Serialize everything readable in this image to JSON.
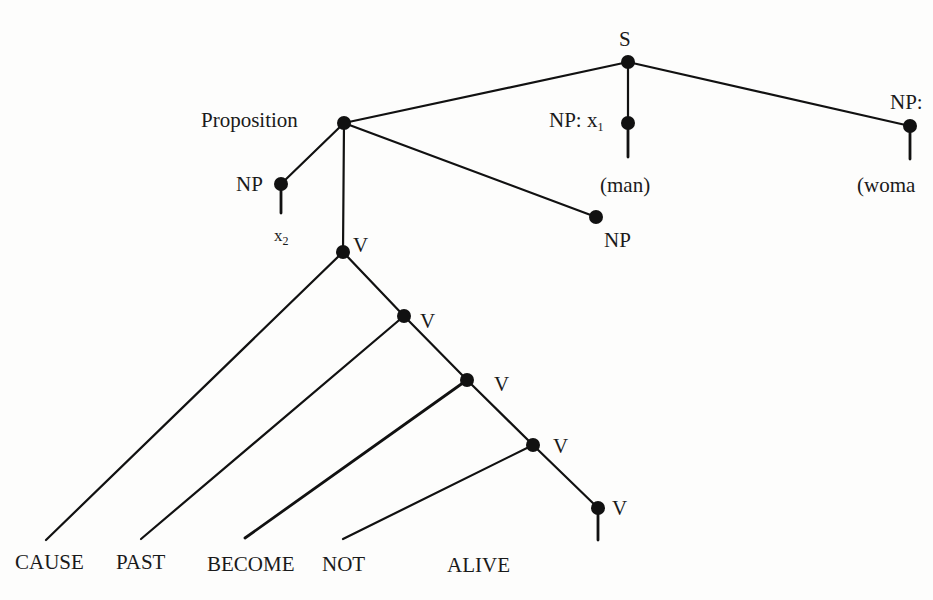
{
  "diagram": {
    "type": "syntax-tree",
    "colors": {
      "ink": "#111111",
      "background": "#fdfdfc"
    },
    "nodes": {
      "s": {
        "label": "S"
      },
      "proposition": {
        "label": "Proposition"
      },
      "np_x1": {
        "label": "NP: x",
        "subscript": "1",
        "child": "(man)"
      },
      "np_right": {
        "label": "NP:",
        "child": "(woma"
      },
      "np_x2": {
        "label": "NP",
        "child": "x",
        "child_subscript": "2"
      },
      "np_mid": {
        "label": "NP"
      },
      "v1": {
        "label": "V"
      },
      "v2": {
        "label": "V"
      },
      "v3": {
        "label": "V"
      },
      "v4": {
        "label": "V"
      },
      "v5": {
        "label": "V"
      }
    },
    "leaves": [
      "CAUSE",
      "PAST",
      "BECOME",
      "NOT",
      "ALIVE"
    ]
  }
}
